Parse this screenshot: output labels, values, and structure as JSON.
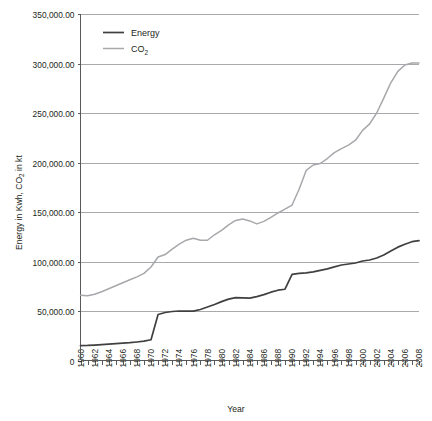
{
  "chart_data": {
    "type": "line",
    "title": "",
    "xlabel": "Year",
    "ylabel": "Energy in Kwh, CO2 in kt",
    "ylabel_parts": {
      "pre": "Energy in Kwh, CO",
      "sub": "2",
      "post": " in kt"
    },
    "ylim": [
      0,
      350000
    ],
    "ytick_values": [
      0,
      50000,
      100000,
      150000,
      200000,
      250000,
      300000,
      350000
    ],
    "ytick_labels": [
      "0",
      "50,000.00",
      "100,000.00",
      "150,000.00",
      "200,000.00",
      "250,000.00",
      "300,000.00",
      "350,000.00"
    ],
    "xlim": [
      1960,
      2008
    ],
    "xtick_labels": [
      "1960",
      "1962",
      "1964",
      "1966",
      "1968",
      "1970",
      "1972",
      "1974",
      "1976",
      "1978",
      "1980",
      "1982",
      "1984",
      "1986",
      "1988",
      "1990",
      "1992",
      "1994",
      "1996",
      "1998",
      "2000",
      "2002",
      "2004",
      "2006",
      "2008"
    ],
    "xtick_step_minor": 1,
    "xtick_step_labeled": 2,
    "grid": "horizontal",
    "legend_position": "top-left-inside",
    "x": [
      1960,
      1961,
      1962,
      1963,
      1964,
      1965,
      1966,
      1967,
      1968,
      1969,
      1970,
      1971,
      1972,
      1973,
      1974,
      1975,
      1976,
      1977,
      1978,
      1979,
      1980,
      1981,
      1982,
      1983,
      1984,
      1985,
      1986,
      1987,
      1988,
      1989,
      1990,
      1991,
      1992,
      1993,
      1994,
      1995,
      1996,
      1997,
      1998,
      1999,
      2000,
      2001,
      2002,
      2003,
      2004,
      2005,
      2006,
      2007,
      2008
    ],
    "series": [
      {
        "name": "Energy",
        "color": "#404041",
        "values": [
          15000,
          15200,
          15600,
          16000,
          16500,
          17000,
          17500,
          18000,
          18700,
          19500,
          21000,
          46500,
          48500,
          49500,
          50000,
          49800,
          49800,
          51500,
          54000,
          56500,
          59500,
          62000,
          63500,
          63200,
          63000,
          64500,
          66500,
          69000,
          71000,
          72000,
          87000,
          88000,
          88500,
          89500,
          91000,
          92500,
          94500,
          96500,
          97500,
          98500,
          100500,
          101500,
          103500,
          106500,
          110500,
          114500,
          117500,
          120000,
          121000
        ]
      },
      {
        "name": "CO2",
        "color": "#a6a8ab",
        "values": [
          66000,
          65500,
          67000,
          69500,
          72500,
          75500,
          78500,
          81500,
          84500,
          88000,
          94500,
          104500,
          107000,
          112500,
          117500,
          121500,
          123500,
          121500,
          121500,
          127000,
          131500,
          137000,
          141500,
          143000,
          141000,
          138000,
          140500,
          144500,
          149000,
          153000,
          157000,
          173000,
          192000,
          197500,
          199000,
          204000,
          210000,
          214000,
          217500,
          222500,
          232500,
          239000,
          250000,
          265000,
          280500,
          292000,
          298500,
          300500,
          300500
        ]
      }
    ],
    "legend_entries": [
      {
        "label": "Energy",
        "color": "#404041"
      },
      {
        "label": "CO",
        "sub": "2",
        "color": "#a6a8ab"
      }
    ]
  }
}
